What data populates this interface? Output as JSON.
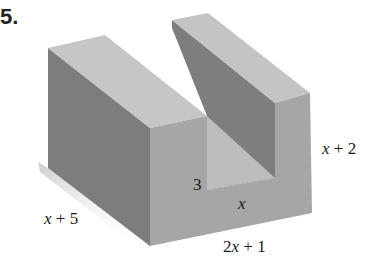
{
  "problem": {
    "number": "5."
  },
  "figure": {
    "labels": {
      "depth": {
        "var": "x",
        "rest": " + 5"
      },
      "width": {
        "coef": "2",
        "var": "x",
        "rest": " + 1"
      },
      "height": {
        "var": "x",
        "rest": " + 2"
      },
      "channel_depth": "3",
      "channel_width": {
        "var": "x"
      }
    },
    "colors": {
      "top_face": "#c4c4c4",
      "left_face": "#7d7d7d",
      "front_face": "#a5a5a5",
      "inner_wall_dark": "#8a8a8a",
      "inner_floor": "#bdbdbd",
      "shadow": "#d8d8d8"
    }
  }
}
